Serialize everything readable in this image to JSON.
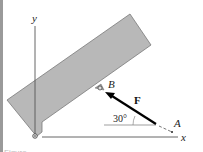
{
  "figure": {
    "labels": {
      "y_axis": "y",
      "x_axis": "x",
      "point_b": "B",
      "point_a": "A",
      "force": "F",
      "angle": "30°"
    },
    "caption": "Figure",
    "colors": {
      "plate_fill": "#b8b8b8",
      "plate_stroke": "#7a7a7a",
      "axis": "#555555",
      "force_arrow": "#000000",
      "left_border": "#9a9a9a"
    }
  }
}
